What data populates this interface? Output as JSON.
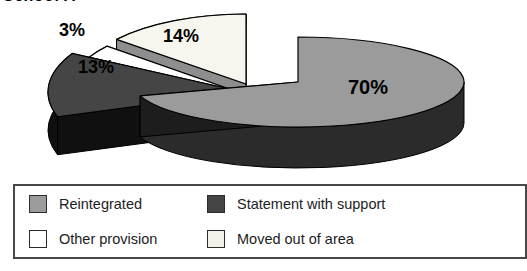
{
  "title": "School A",
  "chart_data": {
    "type": "pie",
    "title": "School A",
    "style": "3d-exploded",
    "unit": "%",
    "total": 100,
    "slices": [
      {
        "label": "Reintegrated",
        "value": 70,
        "display": "70%",
        "color": "#9b9b9b",
        "side_color": "#2b2b2b",
        "exploded": false
      },
      {
        "label": "Moved out of area",
        "value": 14,
        "display": "14%",
        "color": "#f7f6ee",
        "side_color": "#8e8e8e",
        "exploded": true
      },
      {
        "label": "Other provision",
        "value": 3,
        "display": "3%",
        "color": "#ffffff",
        "side_color": "#e8e8e8",
        "exploded": true
      },
      {
        "label": "Statement with support",
        "value": 13,
        "display": "13%",
        "color": "#454545",
        "side_color": "#101010",
        "exploded": true
      }
    ],
    "legend_position": "bottom"
  },
  "legend": {
    "items": [
      {
        "label": "Reintegrated",
        "color": "#9b9b9b"
      },
      {
        "label": "Statement with support",
        "color": "#454545"
      },
      {
        "label": "Other provision",
        "color": "#ffffff"
      },
      {
        "label": "Moved out of area",
        "color": "#f2f1e9"
      }
    ]
  },
  "colors": {
    "outline": "#000000",
    "legend_border": "#484848",
    "background": "#ffffff"
  }
}
